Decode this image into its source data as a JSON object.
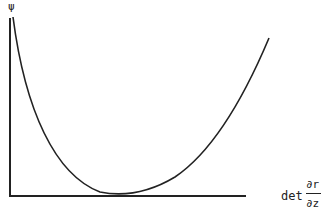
{
  "diagram": {
    "y_axis_label": "ψ",
    "x_axis_label": "det",
    "fraction_numerator": "∂r",
    "fraction_denominator": "∂z",
    "curve_points": [
      [
        12,
        17
      ],
      [
        20,
        60
      ],
      [
        35,
        110
      ],
      [
        55,
        150
      ],
      [
        80,
        178
      ],
      [
        113,
        193
      ],
      [
        150,
        188
      ],
      [
        190,
        160
      ],
      [
        230,
        110
      ],
      [
        269,
        38
      ]
    ],
    "line_color": "#222222"
  }
}
